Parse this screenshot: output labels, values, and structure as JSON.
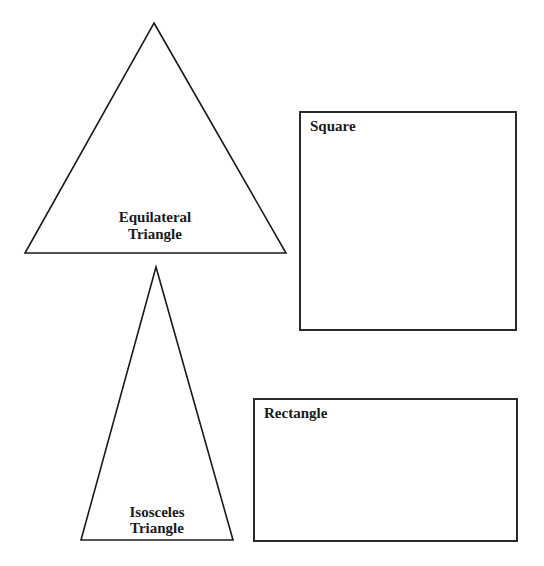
{
  "diagram": {
    "background": "#ffffff",
    "stroke_color": "#1a1a1a",
    "shapes": [
      {
        "id": "equilateral-triangle",
        "type": "triangle",
        "points": [
          [
            154,
            23
          ],
          [
            286,
            253
          ],
          [
            25,
            253
          ]
        ],
        "label_lines": [
          "Equilateral",
          "Triangle"
        ],
        "label_positions": [
          [
            155,
            222
          ],
          [
            155,
            239
          ]
        ],
        "label_anchor": "middle"
      },
      {
        "id": "square",
        "type": "rect",
        "x": 300,
        "y": 112,
        "width": 216,
        "height": 218,
        "label_lines": [
          "Square"
        ],
        "label_positions": [
          [
            310,
            131
          ]
        ],
        "label_anchor": "start"
      },
      {
        "id": "isosceles-triangle",
        "type": "triangle",
        "points": [
          [
            156,
            267
          ],
          [
            233,
            540
          ],
          [
            81,
            540
          ]
        ],
        "label_lines": [
          "Isosceles",
          "Triangle"
        ],
        "label_positions": [
          [
            157,
            517
          ],
          [
            157,
            533
          ]
        ],
        "label_anchor": "middle"
      },
      {
        "id": "rectangle",
        "type": "rect",
        "x": 254,
        "y": 399,
        "width": 263,
        "height": 142,
        "label_lines": [
          "Rectangle"
        ],
        "label_positions": [
          [
            264,
            418
          ]
        ],
        "label_anchor": "start"
      }
    ]
  },
  "labels": {
    "equilateral_line1": "Equilateral",
    "equilateral_line2": "Triangle",
    "square": "Square",
    "isosceles_line1": "Isosceles",
    "isosceles_line2": "Triangle",
    "rectangle": "Rectangle"
  }
}
